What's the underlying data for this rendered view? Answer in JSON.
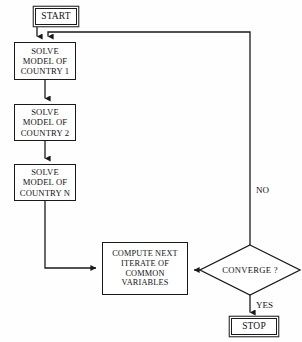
{
  "diagram": {
    "background_color": "#fefefe",
    "stroke_color": "#1a1a1a",
    "text_color": "#121212",
    "nodes": {
      "start": {
        "label": "START",
        "shape": "terminal",
        "x": 35,
        "y": 8,
        "w": 42,
        "h": 17,
        "font_size": 9.5
      },
      "solve1": {
        "shape": "process",
        "x": 14,
        "y": 42,
        "w": 62,
        "h": 38,
        "font_size": 8.6,
        "lines": [
          "SOLVE",
          "MODEL OF",
          "COUNTRY 1"
        ]
      },
      "solve2": {
        "shape": "process",
        "x": 14,
        "y": 104,
        "w": 62,
        "h": 37,
        "font_size": 8.6,
        "lines": [
          "SOLVE",
          "MODEL OF",
          "COUNTRY 2"
        ]
      },
      "solveN": {
        "shape": "process",
        "x": 14,
        "y": 164,
        "w": 62,
        "h": 37,
        "font_size": 8.6,
        "lines": [
          "SOLVE",
          "MODEL OF",
          "COUNTRY N"
        ]
      },
      "compute": {
        "shape": "process",
        "x": 102,
        "y": 242,
        "w": 86,
        "h": 53,
        "font_size": 8.3,
        "lines": [
          "COMPUTE NEXT",
          "ITERATE OF",
          "COMMON",
          "VARIABLES"
        ]
      },
      "converge": {
        "label": "CONVERGE ?",
        "shape": "decision",
        "cx": 250,
        "cy": 270,
        "w": 100,
        "h": 50,
        "font_size": 8.6
      },
      "stop": {
        "label": "STOP",
        "shape": "terminal",
        "x": 231,
        "y": 318,
        "w": 46,
        "h": 17,
        "font_size": 9.5
      }
    },
    "edge_labels": [
      {
        "id": "no-label",
        "text": "NO",
        "x": 256,
        "y": 185,
        "font_size": 9
      },
      {
        "id": "yes-label",
        "text": "YES",
        "x": 256,
        "y": 300,
        "font_size": 9
      }
    ],
    "edges": [
      {
        "id": "start-to-solve1",
        "from": "start",
        "to": "solve1",
        "kind": "vertical-arrow"
      },
      {
        "id": "feedback-to-solve1",
        "from": "converge",
        "to": "solve1",
        "kind": "feedback-loop",
        "label": "NO"
      },
      {
        "id": "solve1-to-solve2",
        "from": "solve1",
        "to": "solve2",
        "kind": "vertical-arrow"
      },
      {
        "id": "solve2-to-solveN",
        "from": "solve2",
        "to": "solveN",
        "kind": "vertical-arrow"
      },
      {
        "id": "solveN-to-compute",
        "from": "solveN",
        "to": "compute",
        "kind": "elbow-arrow"
      },
      {
        "id": "converge-to-compute",
        "from": "converge",
        "to": "compute",
        "kind": "horizontal-arrow"
      },
      {
        "id": "converge-to-stop",
        "from": "converge",
        "to": "stop",
        "kind": "vertical-arrow",
        "label": "YES"
      }
    ]
  }
}
